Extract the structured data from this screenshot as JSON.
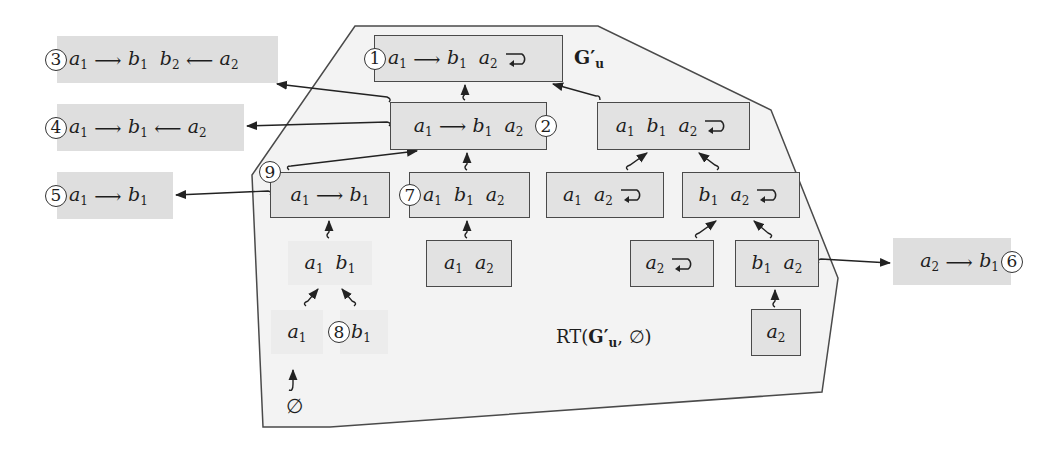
{
  "diagram": {
    "region_label": "RT(G'u, ∅)",
    "graph_label": "G'u",
    "colors": {
      "node_fill": "#e2e2e2",
      "external_fill": "#dedede",
      "faint_fill": "#ececec",
      "region_fill": "#f3f3f3",
      "stroke": "#4a4a4a"
    },
    "nodes": [
      {
        "id": "n1",
        "marker": "1",
        "content": "a1 → b1  a2 ↻",
        "role": "root G'u"
      },
      {
        "id": "n2",
        "marker": "2",
        "content": "a1 → b1  a2"
      },
      {
        "id": "n3",
        "marker": "",
        "content": "a1  b1  a2 ↻"
      },
      {
        "id": "n9",
        "marker": "9",
        "content": "a1 → b1"
      },
      {
        "id": "n7",
        "marker": "7",
        "content": "a1  b1  a2"
      },
      {
        "id": "n10",
        "marker": "",
        "content": "a1  a2 ↻"
      },
      {
        "id": "n11",
        "marker": "",
        "content": "b1  a2 ↻"
      },
      {
        "id": "n12",
        "marker": "",
        "content": "a1  a2"
      },
      {
        "id": "n13",
        "marker": "",
        "content": "a2 ↻"
      },
      {
        "id": "n14",
        "marker": "",
        "content": "b1  a2"
      },
      {
        "id": "n15",
        "marker": "",
        "content": "a2"
      },
      {
        "id": "f1",
        "marker": "",
        "content": "a1  b1",
        "style": "faint"
      },
      {
        "id": "f2",
        "marker": "",
        "content": "a1",
        "style": "faint"
      },
      {
        "id": "f3",
        "marker": "8",
        "content": "b1",
        "style": "faint"
      },
      {
        "id": "empty",
        "marker": "",
        "content": "∅"
      }
    ],
    "external_nodes": [
      {
        "id": "e3",
        "marker": "3",
        "content": "a1 → b1  b2 ← a2"
      },
      {
        "id": "e4",
        "marker": "4",
        "content": "a1 → b1 ← a2"
      },
      {
        "id": "e5",
        "marker": "5",
        "content": "a1 → b1"
      },
      {
        "id": "e6",
        "marker": "6",
        "content": "a2 → b1"
      }
    ],
    "edges": [
      {
        "from": "n2",
        "to": "n1"
      },
      {
        "from": "n3",
        "to": "n1"
      },
      {
        "from": "n9",
        "to": "n2"
      },
      {
        "from": "n7",
        "to": "n2"
      },
      {
        "from": "n10",
        "to": "n3"
      },
      {
        "from": "n11",
        "to": "n3"
      },
      {
        "from": "n12",
        "to": "n7"
      },
      {
        "from": "n13",
        "to": "n11"
      },
      {
        "from": "n14",
        "to": "n11"
      },
      {
        "from": "n15",
        "to": "n14"
      },
      {
        "from": "f1",
        "to": "n9"
      },
      {
        "from": "f2",
        "to": "f1"
      },
      {
        "from": "f3",
        "to": "f1"
      },
      {
        "from": "empty",
        "to": "f2"
      },
      {
        "from": "n2",
        "to": "e3"
      },
      {
        "from": "n2",
        "to": "e4"
      },
      {
        "from": "n9",
        "to": "e5"
      },
      {
        "from": "n14",
        "to": "e6"
      }
    ]
  },
  "labels": {
    "m1": "1",
    "m2": "2",
    "m3": "3",
    "m4": "4",
    "m5": "5",
    "m6": "6",
    "m7": "7",
    "m8": "8",
    "m9": "9",
    "a": "a",
    "b": "b",
    "s1": "1",
    "s2": "2",
    "arrow_r": "⟶",
    "arrow_l": "⟵",
    "empty": "∅",
    "G": "G",
    "prime": "′",
    "u": "u",
    "rt_prefix": "RT(",
    "rt_suffix": ", ∅)"
  }
}
